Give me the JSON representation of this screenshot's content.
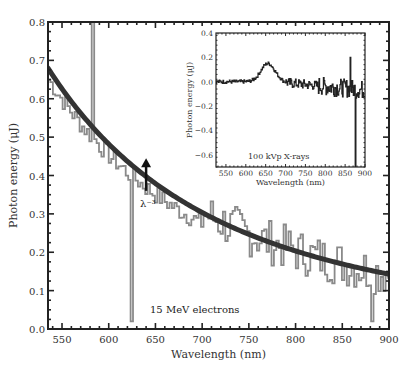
{
  "chart_data": [
    {
      "type": "line",
      "title": "",
      "annotation": "15 MeV electrons",
      "fit_label": "λ⁻³",
      "xlabel": "Wavelength (nm)",
      "ylabel": "Photon energy (μJ)",
      "xlim": [
        535,
        900
      ],
      "ylim": [
        0.0,
        0.8
      ],
      "xticks": [
        550,
        600,
        650,
        700,
        750,
        800,
        850,
        900
      ],
      "yticks": [
        0.0,
        0.1,
        0.2,
        0.3,
        0.4,
        0.5,
        0.6,
        0.7,
        0.8
      ],
      "ytick_labels": [
        "0.0",
        "0.1",
        "0.2",
        "0.3",
        "0.4",
        "0.5",
        "0.6",
        "0.7",
        "0.8"
      ],
      "grid": false,
      "series": [
        {
          "name": "measured spectrum",
          "color": "#8a8a8a",
          "x": [
            535,
            545,
            555,
            565,
            575,
            583,
            590,
            600,
            610,
            620,
            624,
            630,
            640,
            650,
            660,
            670,
            680,
            690,
            700,
            710,
            720,
            730,
            740,
            750,
            760,
            770,
            780,
            790,
            800,
            810,
            820,
            830,
            840,
            850,
            860,
            870,
            880,
            890,
            900
          ],
          "y": [
            0.6,
            0.58,
            0.55,
            0.52,
            0.5,
            0.8,
            0.48,
            0.44,
            0.43,
            0.4,
            0.02,
            0.42,
            0.38,
            0.36,
            0.38,
            0.37,
            0.33,
            0.31,
            0.32,
            0.3,
            0.28,
            0.29,
            0.26,
            0.25,
            0.26,
            0.24,
            0.22,
            0.25,
            0.2,
            0.21,
            0.22,
            0.2,
            0.21,
            0.22,
            0.21,
            0.22,
            0.02,
            0.2,
            0.18
          ]
        },
        {
          "name": "λ^-3 fit",
          "color": "#333333",
          "formula": "0.68 * (535/λ)^3",
          "x": [
            535,
            550,
            600,
            650,
            700,
            750,
            800,
            850,
            900
          ],
          "y": [
            0.68,
            0.626,
            0.482,
            0.379,
            0.304,
            0.247,
            0.203,
            0.17,
            0.143
          ]
        }
      ],
      "arrow": {
        "x": 640,
        "y_from": 0.36,
        "y_to": 0.44
      }
    },
    {
      "type": "line",
      "title": "",
      "inset": true,
      "annotation": "100 kVp X-rays",
      "xlabel": "Wavelength (nm)",
      "ylabel": "Photon energy (μJ)",
      "xlim": [
        525,
        900
      ],
      "ylim": [
        -0.7,
        0.4
      ],
      "xticks": [
        550,
        600,
        650,
        700,
        750,
        800,
        850,
        900
      ],
      "yticks": [
        -0.6,
        -0.4,
        -0.2,
        0.0,
        0.2,
        0.4
      ],
      "ytick_labels": [
        "−0.6",
        "−0.4",
        "−0.2",
        "0.0",
        "0.2",
        "0.4"
      ],
      "grid": false,
      "series": [
        {
          "name": "X-ray spectrum",
          "color": "#222222",
          "x": [
            525,
            550,
            575,
            600,
            625,
            640,
            655,
            670,
            690,
            710,
            730,
            750,
            770,
            790,
            810,
            830,
            850,
            862,
            875,
            890,
            900
          ],
          "y": [
            0.0,
            0.0,
            -0.02,
            0.0,
            0.03,
            0.11,
            0.15,
            0.12,
            0.06,
            0.02,
            0.01,
            0.0,
            -0.02,
            -0.03,
            -0.05,
            -0.06,
            -0.08,
            0.2,
            -0.75,
            -0.1,
            -0.05
          ]
        }
      ]
    }
  ]
}
